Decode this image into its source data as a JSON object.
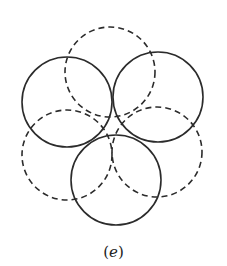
{
  "figure": {
    "caption_open": "(",
    "caption_var": "e",
    "caption_close": ")",
    "stroke_color": "#2b2b2b",
    "circles": [
      {
        "id": "dashed-top",
        "style": "dashed",
        "cx": 110,
        "cy": 72,
        "r": 45
      },
      {
        "id": "solid-left",
        "style": "solid",
        "cx": 67,
        "cy": 102,
        "r": 45
      },
      {
        "id": "solid-right",
        "style": "solid",
        "cx": 158,
        "cy": 97,
        "r": 45
      },
      {
        "id": "dashed-left",
        "style": "dashed",
        "cx": 67,
        "cy": 155,
        "r": 45
      },
      {
        "id": "dashed-right",
        "style": "dashed",
        "cx": 157,
        "cy": 152,
        "r": 45
      },
      {
        "id": "solid-bottom",
        "style": "solid",
        "cx": 116,
        "cy": 180,
        "r": 45
      }
    ]
  }
}
